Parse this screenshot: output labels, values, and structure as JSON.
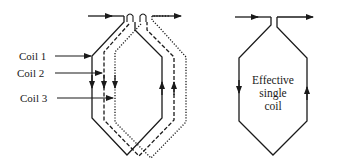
{
  "diagram": {
    "title": "",
    "left_group": {
      "labels": [
        {
          "id": "coil1",
          "text": "Coil 1",
          "line_style": "solid"
        },
        {
          "id": "coil2",
          "text": "Coil 2",
          "line_style": "dashed"
        },
        {
          "id": "coil3",
          "text": "Coil 3",
          "line_style": "dotted"
        }
      ],
      "current_direction": {
        "left_side": "down",
        "right_side": "up",
        "input": "right-arrow at top-left",
        "output": "right-arrow at top-right"
      }
    },
    "right_group": {
      "label_lines": [
        "Effective",
        "single",
        "coil"
      ],
      "line_style": "solid",
      "current_direction": {
        "left_side": "down",
        "right_side": "up"
      }
    },
    "colors": {
      "line": "#1a1a1a",
      "background": "#ffffff"
    }
  }
}
